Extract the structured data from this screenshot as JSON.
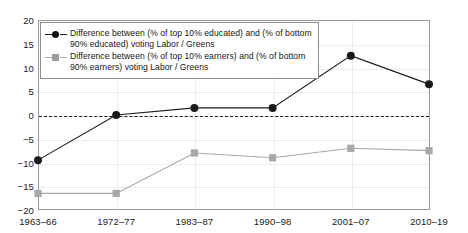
{
  "chart_data": {
    "type": "line",
    "title": "",
    "subtitle": "",
    "xlabel": "",
    "ylabel": "",
    "categories": [
      "1963–66",
      "1972–77",
      "1983–87",
      "1990–98",
      "2001–07",
      "2010–19"
    ],
    "ylim": [
      -20,
      20
    ],
    "yticks": [
      20,
      15,
      10,
      5,
      0,
      -5,
      -10,
      -15,
      -20
    ],
    "ytick_labels": [
      "20",
      "15",
      "10",
      "5",
      "0",
      "−5",
      "−10",
      "−15",
      "−20"
    ],
    "grid": true,
    "legend_position": "upper-left",
    "zero_reference_line": true,
    "series": [
      {
        "name": "Difference between (% of top 10% educated) and (% of bottom 90% educated) voting Labor / Greens",
        "legend_label_line1": "Difference between (% of top 10% educated) and (% of bottom",
        "legend_label_line2": "90% educated) voting Labor / Greens",
        "marker": "circle",
        "color": "#1a1a1a",
        "values": [
          -9.5,
          0,
          1.5,
          1.5,
          12.5,
          6.5
        ]
      },
      {
        "name": "Difference between (% of top 10% earners) and (% of bottom 90% earners) voting Labor / Greens",
        "legend_label_line1": "Difference between (% of top 10% earners) and (% of bottom",
        "legend_label_line2": "90% earners) voting Labor / Greens",
        "marker": "square",
        "color": "#a8a8a8",
        "values": [
          -16.5,
          -16.5,
          -8,
          -9,
          -7,
          -7.5
        ]
      }
    ]
  },
  "colors": {
    "educated_series": "#1a1a1a",
    "earners_series": "#a8a8a8",
    "axis": "#9a9a9a",
    "grid": "#ececec",
    "background": "#ffffff"
  }
}
